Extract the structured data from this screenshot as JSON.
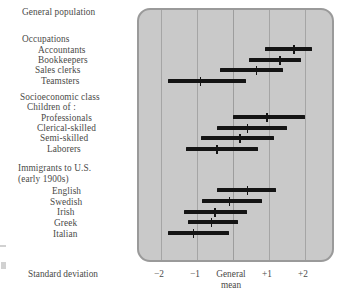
{
  "chart_data": {
    "type": "bar",
    "subtype": "range-bar-with-mean-marker",
    "title": "",
    "xlabel": "Standard deviation",
    "ylabel": "",
    "xlim": [
      -2.6,
      2.9
    ],
    "grid": true,
    "grid_axis": "x",
    "legend": false,
    "xticks": [
      -2,
      -1,
      0,
      1,
      2
    ],
    "xticklabels": [
      "−2",
      "−1",
      "General mean",
      "+1",
      "+2"
    ],
    "zero_label_line1": "General",
    "zero_label_line2": "mean",
    "units_per_sd_px": 36,
    "groups": [
      {
        "name": "General population",
        "has_bar": false,
        "rows": []
      },
      {
        "name": "Occupations",
        "has_bar": false,
        "rows": [
          {
            "label": "Accountants",
            "low": 0.9,
            "high": 2.2,
            "mean": 1.7
          },
          {
            "label": "Bookkeepers",
            "low": 0.45,
            "high": 1.9,
            "mean": 1.3
          },
          {
            "label": "Sales clerks",
            "low": -0.35,
            "high": 1.4,
            "mean": 0.65
          },
          {
            "label": "Teamsters",
            "low": -1.8,
            "high": 0.35,
            "mean": -0.9
          }
        ]
      },
      {
        "name": "Socioeconomic class",
        "subtitle": "Children of :",
        "has_bar": false,
        "rows": [
          {
            "label": "Professionals",
            "low": 0.0,
            "high": 2.0,
            "mean": 0.95
          },
          {
            "label": "Clerical-skilled",
            "low": -0.45,
            "high": 1.5,
            "mean": 0.4
          },
          {
            "label": "Semi-skilled",
            "low": -0.9,
            "high": 1.15,
            "mean": 0.2
          },
          {
            "label": "Laborers",
            "low": -1.3,
            "high": 0.7,
            "mean": -0.45
          }
        ]
      },
      {
        "name": "Immigrants to U.S.",
        "subtitle": "(early 1900s)",
        "has_bar": false,
        "rows": [
          {
            "label": "English",
            "low": -0.45,
            "high": 1.2,
            "mean": 0.4
          },
          {
            "label": "Swedish",
            "low": -0.85,
            "high": 0.8,
            "mean": -0.1
          },
          {
            "label": "Irish",
            "low": -1.35,
            "high": 0.4,
            "mean": -0.5
          },
          {
            "label": "Greek",
            "low": -1.25,
            "high": 0.15,
            "mean": -0.6
          },
          {
            "label": "Italian",
            "low": -1.8,
            "high": -0.1,
            "mean": -1.1
          }
        ]
      }
    ]
  },
  "labels": {
    "general_population": "General population",
    "occupations": "Occupations",
    "accountants": "Accountants",
    "bookkeepers": "Bookkeepers",
    "sales_clerks": "Sales clerks",
    "teamsters": "Teamsters",
    "socioeconomic_class": "Socioeconomic class",
    "children_of": "Children of :",
    "professionals": "Professionals",
    "clerical_skilled": "Clerical-skilled",
    "semi_skilled": "Semi-skilled",
    "laborers": "Laborers",
    "immigrants": "Immigrants to U.S.",
    "immigrants_sub": "(early 1900s)",
    "english": "English",
    "swedish": "Swedish",
    "irish": "Irish",
    "greek": "Greek",
    "italian": "Italian"
  },
  "axis": {
    "title": "Standard deviation",
    "t_minus2": "−2",
    "t_minus1": "−1",
    "t_zero_1": "General",
    "t_zero_2": "mean",
    "t_plus1": "+1",
    "t_plus2": "+2"
  },
  "colors": {
    "panel_fill": "#c9c9c9",
    "panel_border": "#9a9a9a",
    "gridline": "#a5a5a5",
    "bar": "#141414",
    "text": "#4a4a48",
    "page": "#ffffff"
  }
}
